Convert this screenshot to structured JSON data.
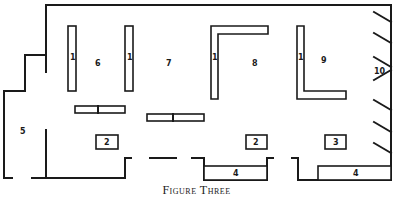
{
  "caption": "Figure Three",
  "labels": {
    "shelf": "1",
    "table_a": "2",
    "table_b": "2",
    "table_c": "3",
    "counter_a": "4",
    "counter_b": "4",
    "room_entry": "5",
    "area_6": "6",
    "area_7": "7",
    "area_8": "8",
    "area_9": "9",
    "area_10": "10"
  },
  "colors": {
    "line": "#1a1a1a",
    "background": "#ffffff"
  }
}
